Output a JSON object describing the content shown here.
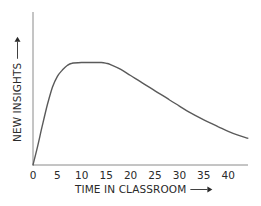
{
  "chart_data": {
    "type": "line",
    "title": "",
    "xlabel": "TIME IN CLASSROOM",
    "ylabel": "NEW INSIGHTS",
    "x_ticks": [
      0,
      5,
      10,
      15,
      20,
      25,
      30,
      35,
      40
    ],
    "xlim": [
      0,
      44
    ],
    "ylim": [
      0,
      100
    ],
    "y_ticks": [],
    "grid": false,
    "legend": null,
    "series": [
      {
        "name": "New insights",
        "color": "#5a5a5a",
        "x": [
          0,
          1,
          2,
          3,
          4,
          5,
          6,
          7,
          8,
          10,
          12,
          14,
          15,
          16,
          18,
          20,
          22,
          25,
          28,
          30,
          32,
          35,
          38,
          40,
          42,
          44
        ],
        "y": [
          0,
          13,
          27,
          40,
          51,
          58,
          62,
          65,
          66.5,
          67,
          67,
          67,
          66.5,
          65.5,
          62.5,
          58.5,
          54.5,
          48.5,
          42.5,
          38.5,
          34.5,
          29.5,
          25,
          22,
          19.5,
          17.5
        ]
      }
    ]
  },
  "labels": {
    "x_axis_title": "TIME IN CLASSROOM",
    "y_axis_title": "NEW INSIGHTS",
    "arrow_glyph": "→"
  },
  "colors": {
    "axis": "#8a8a8a",
    "curve": "#5a5a5a",
    "text": "#2a2a2a"
  }
}
